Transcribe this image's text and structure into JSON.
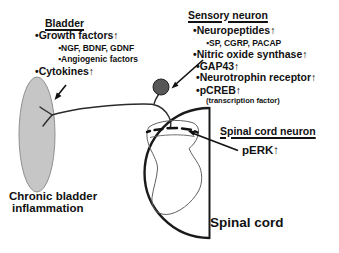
{
  "figure": {
    "bladder_panel": {
      "title": "Bladder",
      "items": [
        "•Growth factors↑",
        "▪NGF, BDNF, GDNF",
        "▪Angiogenic factors",
        "•Cytokines↑"
      ]
    },
    "sensory_panel": {
      "title": "Sensory neuron",
      "items": [
        "•Neuropeptides↑",
        "▪SP, CGRP, PACAP",
        "•Nitric oxide synthase↑",
        "•GAP43↑",
        "•Neurotrophin receptor↑",
        "•pCREB↑"
      ],
      "note": "(transcription factor)"
    },
    "spinal_neuron_panel": {
      "title": "Spinal cord neuron",
      "item": "pERK↑"
    },
    "captions": {
      "inflammation_line1": "Chronic bladder",
      "inflammation_line2": "inflammation",
      "spinal_cord": "Spinal cord"
    },
    "colors": {
      "background": "#ffffff",
      "text": "#111111",
      "bladder_fill": "#c6c6c6",
      "bladder_stroke": "#8f8f8f",
      "soma_fill": "#575757",
      "line": "#2b2b2b",
      "cord_outline": "#1a1a1a",
      "gray_matter": "#606060"
    }
  }
}
